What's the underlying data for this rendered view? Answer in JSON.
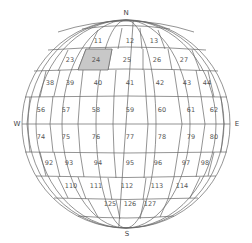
{
  "map": {
    "type": "globe-grid",
    "selected_cell": "24",
    "colors": {
      "grid_line": "#666666",
      "selected_fill": "#c8c8c8",
      "label": "#555555",
      "background": "#ffffff"
    }
  },
  "compass": {
    "north": "N",
    "south": "S",
    "west": "W",
    "east": "E"
  },
  "rows": [
    {
      "cells": [
        "11",
        "12",
        "13"
      ]
    },
    {
      "cells": [
        "23",
        "24",
        "25",
        "26",
        "27"
      ]
    },
    {
      "cells": [
        "38",
        "39",
        "40",
        "41",
        "42",
        "43",
        "44"
      ]
    },
    {
      "cells": [
        "56",
        "57",
        "58",
        "59",
        "60",
        "61",
        "62"
      ]
    },
    {
      "cells": [
        "74",
        "75",
        "76",
        "77",
        "78",
        "79",
        "80"
      ]
    },
    {
      "cells": [
        "92",
        "93",
        "94",
        "95",
        "96",
        "97",
        "98"
      ]
    },
    {
      "cells": [
        "110",
        "111",
        "112",
        "113",
        "114"
      ]
    },
    {
      "cells": [
        "125",
        "126",
        "127"
      ]
    }
  ]
}
